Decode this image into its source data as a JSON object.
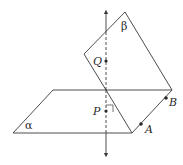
{
  "diagram": {
    "planes": {
      "alpha": {
        "label": "α"
      },
      "beta": {
        "label": "β"
      }
    },
    "points": {
      "Q": {
        "label": "Q"
      },
      "P": {
        "label": "P"
      },
      "A": {
        "label": "A"
      },
      "B": {
        "label": "B"
      }
    },
    "colors": {
      "line": "#3a3a3a",
      "background": "#ffffff"
    }
  }
}
